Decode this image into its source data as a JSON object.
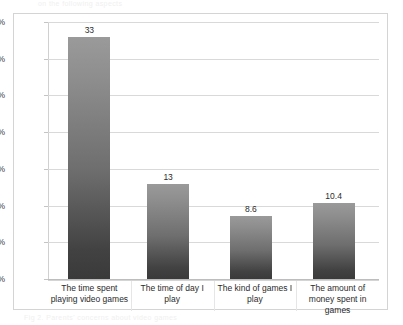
{
  "artifacts": {
    "top_fragment": "on the following aspects",
    "bottom_fragment": "Fig 2. Parents' concerns about video games"
  },
  "chart_data": {
    "type": "bar",
    "title": "",
    "xlabel": "",
    "ylabel": "",
    "categories": [
      "The time spent playing video games",
      "The time of day I play",
      "The kind of games I play",
      "The amount of money spent in games"
    ],
    "values": [
      33,
      13,
      8.6,
      10.4
    ],
    "data_labels": [
      "33",
      "13",
      "8.6",
      "10.4"
    ],
    "ylim": [
      0,
      35
    ],
    "ytick_values": [
      0,
      5,
      10,
      15,
      20,
      25,
      30,
      35
    ],
    "ytick_labels": [
      "0%",
      "5%",
      "10%",
      "15%",
      "20%",
      "25%",
      "30%",
      "35%"
    ],
    "grid": true,
    "legend": "none",
    "bar_color_top": "#9a9a9a",
    "bar_color_bottom": "#3a3a3a",
    "gridline_color": "#d9d9d9",
    "frame_color": "#d4d4d4"
  }
}
